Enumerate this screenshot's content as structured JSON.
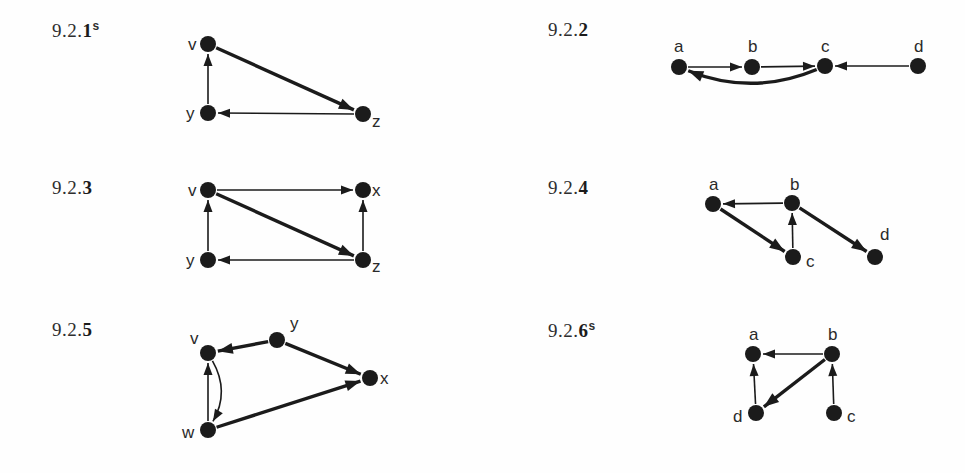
{
  "page": {
    "background_color": "#fefefe",
    "ink_color": "#1b1b1b",
    "label_color": "#2e2e2e"
  },
  "exercises": [
    {
      "id": "9.2.1",
      "number_prefix": "9.2.",
      "number_last": "1",
      "superscript": "s",
      "label_x": 52,
      "label_y": 20,
      "graph": {
        "nodes": [
          {
            "id": "v",
            "label": "v",
            "x": 208,
            "y": 44,
            "label_x": 188,
            "label_y": 36,
            "radius": 8
          },
          {
            "id": "y",
            "label": "y",
            "x": 208,
            "y": 113,
            "label_x": 186,
            "label_y": 105,
            "radius": 8
          },
          {
            "id": "z",
            "label": "z",
            "x": 363,
            "y": 114,
            "label_x": 372,
            "label_y": 113,
            "radius": 8
          }
        ],
        "edges": [
          {
            "from": "y",
            "to": "v",
            "kind": "straight",
            "weight": "thin"
          },
          {
            "from": "v",
            "to": "z",
            "kind": "straight",
            "weight": "thick"
          },
          {
            "from": "z",
            "to": "y",
            "kind": "straight",
            "weight": "thin"
          }
        ]
      }
    },
    {
      "id": "9.2.2",
      "number_prefix": "9.2.",
      "number_last": "2",
      "superscript": "",
      "label_x": 548,
      "label_y": 20,
      "graph": {
        "nodes": [
          {
            "id": "a",
            "label": "a",
            "x": 679,
            "y": 67,
            "label_x": 674,
            "label_y": 38,
            "radius": 8
          },
          {
            "id": "b",
            "label": "b",
            "x": 752,
            "y": 67,
            "label_x": 748,
            "label_y": 38,
            "radius": 8
          },
          {
            "id": "c",
            "label": "c",
            "x": 825,
            "y": 66,
            "label_x": 821,
            "label_y": 38,
            "radius": 8
          },
          {
            "id": "d",
            "label": "d",
            "x": 918,
            "y": 66,
            "label_x": 914,
            "label_y": 38,
            "radius": 8
          }
        ],
        "edges": [
          {
            "from": "a",
            "to": "b",
            "kind": "straight",
            "weight": "thin"
          },
          {
            "from": "b",
            "to": "c",
            "kind": "straight",
            "weight": "thin"
          },
          {
            "from": "d",
            "to": "c",
            "kind": "straight",
            "weight": "thin"
          },
          {
            "from": "c",
            "to": "a",
            "kind": "curved",
            "weight": "thick",
            "bulge": 30
          }
        ]
      }
    },
    {
      "id": "9.2.3",
      "number_prefix": "9.2.",
      "number_last": "3",
      "superscript": "",
      "label_x": 52,
      "label_y": 178,
      "graph": {
        "nodes": [
          {
            "id": "v",
            "label": "v",
            "x": 208,
            "y": 190,
            "label_x": 188,
            "label_y": 182,
            "radius": 8
          },
          {
            "id": "x",
            "label": "x",
            "x": 363,
            "y": 190,
            "label_x": 372,
            "label_y": 182,
            "radius": 8
          },
          {
            "id": "y",
            "label": "y",
            "x": 208,
            "y": 260,
            "label_x": 186,
            "label_y": 252,
            "radius": 8
          },
          {
            "id": "z",
            "label": "z",
            "x": 363,
            "y": 260,
            "label_x": 372,
            "label_y": 258,
            "radius": 8
          }
        ],
        "edges": [
          {
            "from": "v",
            "to": "x",
            "kind": "straight",
            "weight": "thin"
          },
          {
            "from": "y",
            "to": "v",
            "kind": "straight",
            "weight": "thin"
          },
          {
            "from": "v",
            "to": "z",
            "kind": "straight",
            "weight": "thick"
          },
          {
            "from": "z",
            "to": "y",
            "kind": "straight",
            "weight": "thin"
          },
          {
            "from": "z",
            "to": "x",
            "kind": "straight",
            "weight": "thin"
          }
        ]
      }
    },
    {
      "id": "9.2.4",
      "number_prefix": "9.2.",
      "number_last": "4",
      "superscript": "",
      "label_x": 548,
      "label_y": 178,
      "graph": {
        "nodes": [
          {
            "id": "a",
            "label": "a",
            "x": 713,
            "y": 204,
            "label_x": 709,
            "label_y": 176,
            "radius": 8
          },
          {
            "id": "b",
            "label": "b",
            "x": 792,
            "y": 203,
            "label_x": 790,
            "label_y": 176,
            "radius": 8
          },
          {
            "id": "c",
            "label": "c",
            "x": 793,
            "y": 257,
            "label_x": 806,
            "label_y": 253,
            "radius": 8
          },
          {
            "id": "d",
            "label": "d",
            "x": 875,
            "y": 257,
            "label_x": 880,
            "label_y": 226,
            "radius": 8
          }
        ],
        "edges": [
          {
            "from": "b",
            "to": "a",
            "kind": "straight",
            "weight": "thin"
          },
          {
            "from": "a",
            "to": "c",
            "kind": "straight",
            "weight": "thick"
          },
          {
            "from": "c",
            "to": "b",
            "kind": "straight",
            "weight": "thin"
          },
          {
            "from": "b",
            "to": "d",
            "kind": "straight",
            "weight": "thick"
          }
        ]
      }
    },
    {
      "id": "9.2.5",
      "number_prefix": "9.2.",
      "number_last": "5",
      "superscript": "",
      "label_x": 52,
      "label_y": 320,
      "graph": {
        "nodes": [
          {
            "id": "v",
            "label": "v",
            "x": 208,
            "y": 353,
            "label_x": 190,
            "label_y": 330,
            "radius": 8
          },
          {
            "id": "y",
            "label": "y",
            "x": 277,
            "y": 340,
            "label_x": 290,
            "label_y": 315,
            "radius": 8
          },
          {
            "id": "x",
            "label": "x",
            "x": 370,
            "y": 378,
            "label_x": 380,
            "label_y": 370,
            "radius": 8
          },
          {
            "id": "w",
            "label": "w",
            "x": 208,
            "y": 430,
            "label_x": 182,
            "label_y": 424,
            "radius": 8
          }
        ],
        "edges": [
          {
            "from": "y",
            "to": "v",
            "kind": "straight",
            "weight": "thick"
          },
          {
            "from": "y",
            "to": "x",
            "kind": "straight",
            "weight": "thick"
          },
          {
            "from": "w",
            "to": "v",
            "kind": "straight",
            "weight": "thin"
          },
          {
            "from": "v",
            "to": "w",
            "kind": "curved",
            "weight": "thin",
            "bulge": 22
          },
          {
            "from": "w",
            "to": "x",
            "kind": "straight",
            "weight": "thick"
          }
        ]
      }
    },
    {
      "id": "9.2.6",
      "number_prefix": "9.2.",
      "number_last": "6",
      "superscript": "s",
      "label_x": 548,
      "label_y": 320,
      "graph": {
        "nodes": [
          {
            "id": "a",
            "label": "a",
            "x": 753,
            "y": 354,
            "label_x": 749,
            "label_y": 326,
            "radius": 8
          },
          {
            "id": "b",
            "label": "b",
            "x": 832,
            "y": 354,
            "label_x": 828,
            "label_y": 326,
            "radius": 8
          },
          {
            "id": "d",
            "label": "d",
            "x": 756,
            "y": 413,
            "label_x": 733,
            "label_y": 408,
            "radius": 8
          },
          {
            "id": "c",
            "label": "c",
            "x": 834,
            "y": 413,
            "label_x": 847,
            "label_y": 408,
            "radius": 8
          }
        ],
        "edges": [
          {
            "from": "b",
            "to": "a",
            "kind": "straight",
            "weight": "thin"
          },
          {
            "from": "d",
            "to": "a",
            "kind": "straight",
            "weight": "thin"
          },
          {
            "from": "b",
            "to": "d",
            "kind": "straight",
            "weight": "thick"
          },
          {
            "from": "c",
            "to": "b",
            "kind": "straight",
            "weight": "thin"
          }
        ]
      }
    }
  ]
}
